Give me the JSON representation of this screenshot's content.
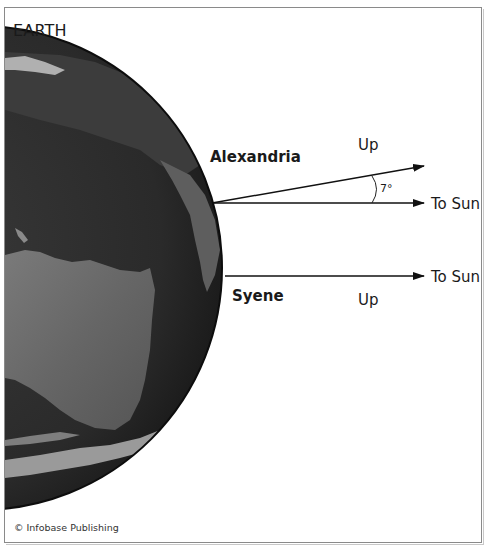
{
  "title": "EARTH",
  "locations": {
    "alexandria": {
      "name": "Alexandria",
      "up_label": "Up",
      "sun_label": "To Sun",
      "angle_label": "7°"
    },
    "syene": {
      "name": "Syene",
      "up_label": "Up",
      "sun_label": "To Sun"
    }
  },
  "credit": "© Infobase Publishing",
  "colors": {
    "ocean": "#2b2b2b",
    "land": "#5e5e5e",
    "land_light": "#767676",
    "ice": "#a8a8a8",
    "arrow": "#111111",
    "frame": "#8a8a8a"
  }
}
